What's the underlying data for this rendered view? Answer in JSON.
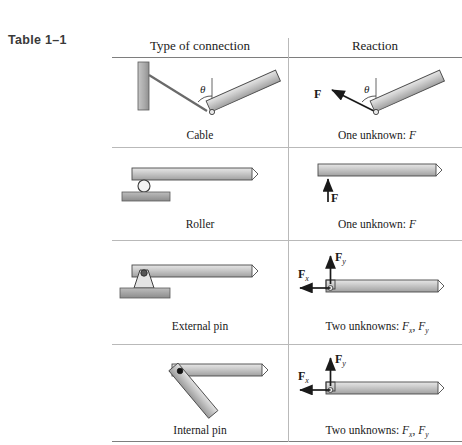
{
  "table": {
    "title": "Table 1–1",
    "columns": [
      {
        "key": "connection",
        "label": "Type of connection"
      },
      {
        "key": "reaction",
        "label": "Reaction"
      }
    ],
    "rows": [
      {
        "id": "cable",
        "connection_caption": "Cable",
        "reaction_caption_prefix": "One unknown: ",
        "reaction_caption_symbol": "F",
        "angle_symbol": "θ",
        "force_labels": [
          "F"
        ],
        "unknown_count": 1
      },
      {
        "id": "roller",
        "connection_caption": "Roller",
        "reaction_caption_prefix": "One unknown: ",
        "reaction_caption_symbol": "F",
        "angle_symbol": "",
        "force_labels": [
          "F"
        ],
        "unknown_count": 1
      },
      {
        "id": "external-pin",
        "connection_caption": "External pin",
        "reaction_caption_prefix": "Two unknowns: ",
        "reaction_caption_symbol": "Fx, Fy",
        "angle_symbol": "",
        "force_labels": [
          "Fx",
          "Fy"
        ],
        "unknown_count": 2
      },
      {
        "id": "internal-pin",
        "connection_caption": "Internal pin",
        "reaction_caption_prefix": "Two unknowns: ",
        "reaction_caption_symbol": "Fx, Fy",
        "angle_symbol": "",
        "force_labels": [
          "Fx",
          "Fy"
        ],
        "unknown_count": 2
      }
    ]
  },
  "labels": {
    "F": "F",
    "F_base": "F",
    "sub_x": "x",
    "sub_y": "y",
    "theta": "θ",
    "comma": ","
  },
  "colors": {
    "beam_fill_light": "#d9d9d9",
    "beam_fill_dark": "#a8a8a8",
    "beam_stroke": "#4a4a4a",
    "wall_fill": "#b0b0b0",
    "rule": "#7e7e7e",
    "rule_light": "#b9b9b9",
    "ink": "#1a1a1a",
    "title": "#3a3a3a"
  }
}
